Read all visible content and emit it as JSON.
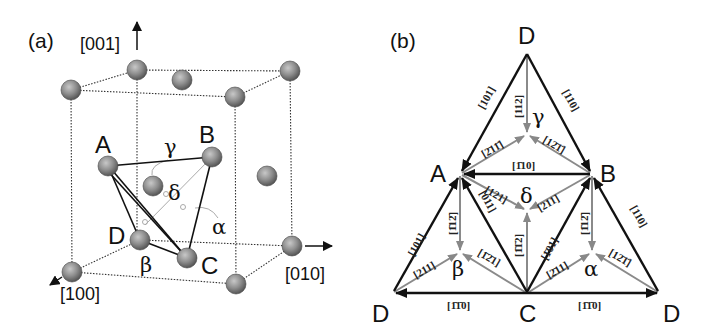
{
  "figure": {
    "panel_a": {
      "label": "(a)",
      "axes": {
        "z": "[001]",
        "y": "[010]",
        "x": "[100]"
      },
      "vertices": {
        "A": "A",
        "B": "B",
        "C": "C",
        "D": "D"
      },
      "greek": {
        "alpha": "α",
        "beta": "β",
        "gamma": "γ",
        "delta": "δ"
      }
    },
    "panel_b": {
      "label": "(b)",
      "vertices": {
        "D_top": "D",
        "A": "A",
        "B": "B",
        "D_left": "D",
        "C": "C",
        "D_right": "D"
      },
      "greek": {
        "gamma": "γ",
        "delta": "δ",
        "beta": "β",
        "alpha": "α"
      },
      "edges": {
        "DA": "[101]",
        "DB": "[1̄1̄0]",
        "BA": "[1̄10]",
        "AD_left": "[101]",
        "AC": "[011]",
        "CB": "[̄1̄0 1]",
        "BD_right": "[110]",
        "CD_left": "[̄1̄1̄0]",
        "CD_right": "[̄1̄1̄0]"
      },
      "edge_labels": {
        "DA": "[101]",
        "DB": "[110]",
        "BA": "[1̄10]",
        "AD_left": "[101]",
        "AC": "[011]",
        "CB": "[1̄01]",
        "BD_right": "[110]",
        "CD_left": "[1̄1̄0]",
        "CD_right": "[1̄1̄0]"
      },
      "partial_labels": {
        "gamma_from_D": "[112]",
        "gamma_from_A": "[2̄11̄]",
        "gamma_from_B": "[12̄1̄]",
        "delta_from_A": "[121]",
        "delta_from_B": "[211]",
        "delta_from_C": "[1̄1̄2]",
        "beta_from_A": "[1̄12̄]",
        "beta_from_D": "[211]",
        "beta_from_C": "[1̄2̄1]",
        "alpha_from_B": "[1̄12̄]",
        "alpha_from_C": "[2̄11]",
        "alpha_from_D": "[12̄1̄]"
      }
    }
  }
}
